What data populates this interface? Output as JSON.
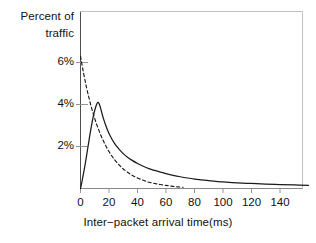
{
  "chart_data": {
    "type": "line",
    "title": "",
    "xlabel": "Inter−packet arrival time(ms)",
    "ylabel_lines": [
      "Percent of",
      "traffic"
    ],
    "ylabel": "Percent of traffic",
    "xlim": [
      0,
      160
    ],
    "ylim": [
      0,
      6.9
    ],
    "grid": false,
    "legend": "none",
    "xticks": [
      {
        "value": 0,
        "label": "0"
      },
      {
        "value": 20,
        "label": "20"
      },
      {
        "value": 40,
        "label": "40"
      },
      {
        "value": 60,
        "label": "60"
      },
      {
        "value": 80,
        "label": "80"
      },
      {
        "value": 100,
        "label": "100"
      },
      {
        "value": 120,
        "label": "120"
      },
      {
        "value": 140,
        "label": "140"
      }
    ],
    "yticks": [
      {
        "value": 2,
        "label": "2%"
      },
      {
        "value": 4,
        "label": "4%"
      },
      {
        "value": 6,
        "label": "6%"
      }
    ],
    "series": [
      {
        "name": "measured-traffic",
        "style": "solid",
        "color": "#1a1a1a",
        "x": [
          0,
          1,
          2,
          3,
          4,
          5,
          6,
          7,
          8,
          9,
          10,
          11,
          12,
          13,
          14,
          15,
          16,
          18,
          20,
          22,
          24,
          26,
          28,
          30,
          33,
          36,
          40,
          44,
          48,
          52,
          56,
          60,
          65,
          70,
          75,
          80,
          85,
          90,
          95,
          100,
          110,
          120,
          130,
          140,
          150,
          160
        ],
        "y": [
          0.0,
          0.32,
          0.68,
          1.05,
          1.45,
          1.88,
          2.3,
          2.72,
          3.1,
          3.45,
          3.72,
          3.95,
          4.1,
          4.05,
          3.85,
          3.6,
          3.35,
          2.95,
          2.62,
          2.36,
          2.14,
          1.96,
          1.8,
          1.66,
          1.49,
          1.35,
          1.19,
          1.06,
          0.95,
          0.86,
          0.78,
          0.71,
          0.63,
          0.56,
          0.5,
          0.45,
          0.41,
          0.37,
          0.34,
          0.31,
          0.27,
          0.24,
          0.21,
          0.19,
          0.17,
          0.15
        ]
      },
      {
        "name": "model-traffic",
        "style": "dashed",
        "color": "#1a1a1a",
        "x": [
          0,
          2,
          4,
          6,
          8,
          10,
          12,
          14,
          16,
          18,
          20,
          22,
          24,
          26,
          28,
          30,
          33,
          36,
          40,
          44,
          48,
          52,
          56,
          60,
          64,
          68,
          72
        ],
        "y": [
          6.3,
          5.55,
          4.88,
          4.3,
          3.78,
          3.33,
          2.93,
          2.58,
          2.27,
          2.0,
          1.76,
          1.55,
          1.36,
          1.2,
          1.06,
          0.93,
          0.77,
          0.64,
          0.5,
          0.39,
          0.3,
          0.24,
          0.19,
          0.15,
          0.11,
          0.08,
          0.06
        ]
      }
    ]
  }
}
